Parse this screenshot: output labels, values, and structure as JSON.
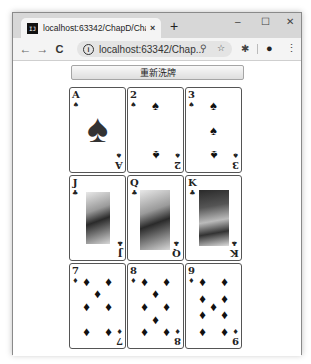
{
  "browser": {
    "tab_title": "localhost:63342/ChapD/ChapD",
    "tab_close": "×",
    "new_tab": "+",
    "window_controls": {
      "minimize": "–",
      "maximize": "☐",
      "close": "✕"
    },
    "nav": {
      "back": "←",
      "forward": "→",
      "reload": "C"
    },
    "info_icon": "i",
    "url": "localhost:63342/Chap...",
    "zoom_icon": "⚲",
    "star_icon": "☆",
    "extension_icon": "✱",
    "profile_icon": "●",
    "menu_icon": "⋮"
  },
  "page": {
    "shuffle_button": "重新洗牌",
    "cards": [
      {
        "rank": "A",
        "suit": "♠",
        "type": "ace"
      },
      {
        "rank": "2",
        "suit": "♠",
        "type": "pips"
      },
      {
        "rank": "3",
        "suit": "♠",
        "type": "pips"
      },
      {
        "rank": "J",
        "suit": "♣",
        "type": "face"
      },
      {
        "rank": "Q",
        "suit": "♣",
        "type": "face"
      },
      {
        "rank": "K",
        "suit": "♣",
        "type": "face"
      },
      {
        "rank": "7",
        "suit": "♦",
        "type": "pips"
      },
      {
        "rank": "8",
        "suit": "♦",
        "type": "pips"
      },
      {
        "rank": "9",
        "suit": "♦",
        "type": "pips"
      }
    ]
  }
}
